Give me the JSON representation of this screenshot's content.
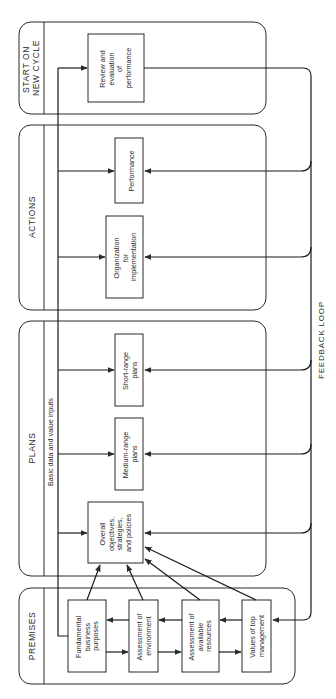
{
  "diagram": {
    "orientation": "rotated-90-ccw",
    "stroke_color": "#2a2a2a",
    "panels": [
      {
        "id": "start",
        "title_line1": "START ON",
        "title_line2": "NEW CYCLE"
      },
      {
        "id": "actions",
        "title": "ACTIONS"
      },
      {
        "id": "plans",
        "title": "PLANS"
      },
      {
        "id": "premises",
        "title": "PREMISES"
      }
    ],
    "input_line_label": "Basic data and value inputs",
    "feedback_label": "FEEDBACK LOOP",
    "boxes": {
      "review": [
        "Review and",
        "evaluation",
        "of",
        "performance"
      ],
      "performance": [
        "Performance"
      ],
      "organization": [
        "Organization",
        "for",
        "implementation"
      ],
      "short_range": [
        "Short-range",
        "plans"
      ],
      "medium_range": [
        "Medium-range",
        "plans"
      ],
      "overall": [
        "Overall",
        "objectives,",
        "strategies,",
        "and policies"
      ],
      "fundamental": [
        "Fundamental",
        "business",
        "purposes"
      ],
      "environment": [
        "Assessment of",
        "environment"
      ],
      "resources": [
        "Assessment of",
        "available",
        "resources"
      ],
      "values": [
        "Values of top",
        "management"
      ]
    }
  }
}
